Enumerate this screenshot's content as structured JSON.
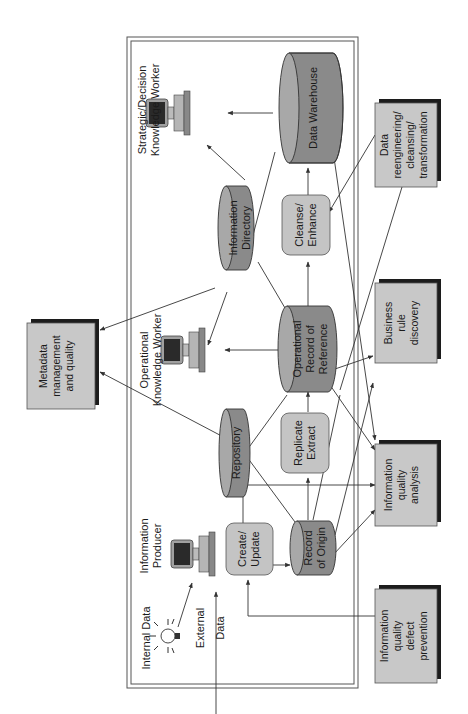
{
  "diagram": {
    "orientation": "rotated 90 degrees counter-clockwise",
    "frame": {
      "style": "double border enclosing information environment"
    },
    "actors": {
      "strategic_worker": {
        "line1": "Strategic/Decision",
        "line2": "Knowledge Worker"
      },
      "operational_worker": {
        "line1": "Operational",
        "line2": "Knowledge Worker"
      },
      "producer": {
        "line1": "Information",
        "line2": "Producer"
      }
    },
    "sources": {
      "internal": {
        "label": "Internal Data"
      },
      "external": {
        "line1": "External",
        "line2": "Data"
      }
    },
    "databases": {
      "data_warehouse": {
        "line1": "Data Warehouse"
      },
      "information_directory": {
        "line1": "Information",
        "line2": "Directory"
      },
      "operational_record": {
        "line1": "Operational",
        "line2": "Record of",
        "line3": "Reference"
      },
      "repository": {
        "line1": "Repository"
      },
      "record_of_origin": {
        "line1": "Record",
        "line2": "of Origin"
      }
    },
    "processes": {
      "cleanse": {
        "line1": "Cleanse/",
        "line2": "Enhance"
      },
      "replicate": {
        "line1": "Replicate",
        "line2": "Extract"
      },
      "create": {
        "line1": "Create/",
        "line2": "Update"
      }
    },
    "quality_boxes": {
      "metadata": {
        "line1": "Metadata",
        "line2": "management",
        "line3": "and quality"
      },
      "reengineering": {
        "line1": "Data",
        "line2": "reengineering/",
        "line3": "cleansing/",
        "line4": "transformation"
      },
      "business_rule": {
        "line1": "Business",
        "line2": "rule",
        "line3": "discovery"
      },
      "analysis": {
        "line1": "Information",
        "line2": "quality",
        "line3": "analysis"
      },
      "prevention": {
        "line1": "Information",
        "line2": "quality",
        "line3": "defect",
        "line4": "prevention"
      }
    },
    "colors": {
      "database_fill": "#8a8a8a",
      "database_top": "#a8a8a8",
      "process_fill": "#c4c4c4",
      "box_fill": "#c8c8c8",
      "box_shadow": "#1c1c1c",
      "line": "#333333"
    }
  }
}
